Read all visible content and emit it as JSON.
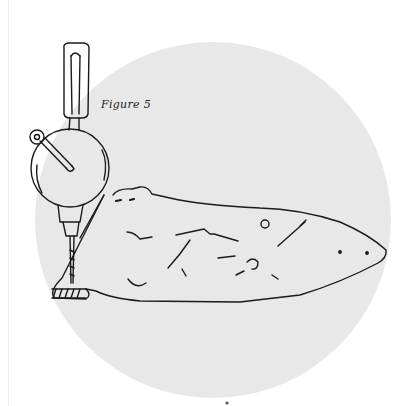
{
  "figure": {
    "caption": "Figure 5",
    "background_circle_color": "#e8e8e8",
    "ink_color": "#1a1a1a"
  }
}
